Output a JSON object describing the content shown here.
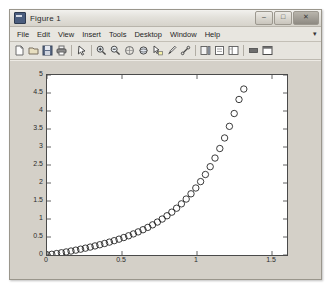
{
  "window": {
    "title": "Figure 1",
    "icon": "matlab-figure-icon",
    "buttons": [
      {
        "name": "minimize",
        "glyph": "–"
      },
      {
        "name": "maximize",
        "glyph": "□"
      },
      {
        "name": "close",
        "glyph": "✕"
      }
    ]
  },
  "menu": {
    "items": [
      "File",
      "Edit",
      "View",
      "Insert",
      "Tools",
      "Desktop",
      "Window",
      "Help"
    ],
    "overflow_glyph": "▾"
  },
  "toolbar": {
    "items": [
      {
        "name": "new-figure-icon",
        "tip": "New Figure"
      },
      {
        "name": "open-file-icon",
        "tip": "Open File"
      },
      {
        "name": "save-figure-icon",
        "tip": "Save Figure"
      },
      {
        "name": "print-figure-icon",
        "tip": "Print Figure"
      },
      {
        "name": "separator-1",
        "tip": ""
      },
      {
        "name": "edit-plot-arrow-icon",
        "tip": "Edit Plot"
      },
      {
        "name": "separator-2",
        "tip": ""
      },
      {
        "name": "zoom-in-icon",
        "tip": "Zoom In"
      },
      {
        "name": "zoom-out-icon",
        "tip": "Zoom Out"
      },
      {
        "name": "pan-icon",
        "tip": "Pan"
      },
      {
        "name": "rotate-3d-icon",
        "tip": "Rotate 3D"
      },
      {
        "name": "data-cursor-icon",
        "tip": "Data Cursor"
      },
      {
        "name": "brush-icon",
        "tip": "Brush/Select Data"
      },
      {
        "name": "link-plot-icon",
        "tip": "Link Plot"
      },
      {
        "name": "separator-3",
        "tip": ""
      },
      {
        "name": "insert-colorbar-icon",
        "tip": "Insert Colorbar"
      },
      {
        "name": "insert-legend-icon",
        "tip": "Insert Legend"
      },
      {
        "name": "show-plot-tools-icon",
        "tip": "Show Plot Tools"
      },
      {
        "name": "separator-4",
        "tip": ""
      },
      {
        "name": "hide-plot-tools-icon",
        "tip": "Hide Plot Tools"
      },
      {
        "name": "dock-figure-icon",
        "tip": "Dock Figure"
      }
    ]
  },
  "chart_data": {
    "type": "scatter",
    "title": "",
    "xlabel": "",
    "ylabel": "",
    "xlim": [
      0,
      1.6
    ],
    "ylim": [
      0,
      5
    ],
    "xticks": [
      0,
      0.5,
      1,
      1.5
    ],
    "xtick_labels": [
      "0",
      "0.5",
      "1",
      "1.5"
    ],
    "yticks": [
      0,
      0.5,
      1,
      1.5,
      2,
      2.5,
      3,
      3.5,
      4,
      4.5,
      5
    ],
    "ytick_labels": [
      "0",
      "0.5",
      "1",
      "1.5",
      "2",
      "2.5",
      "3",
      "3.5",
      "4",
      "4.5",
      "5"
    ],
    "grid": false,
    "legend": null,
    "marker": "circle-open",
    "marker_color": "#1a1a1a",
    "marker_size": 3.2,
    "series": [
      {
        "name": "data",
        "x": [
          0.0,
          0.032,
          0.064,
          0.096,
          0.128,
          0.16,
          0.192,
          0.224,
          0.256,
          0.288,
          0.32,
          0.352,
          0.384,
          0.416,
          0.448,
          0.48,
          0.512,
          0.544,
          0.576,
          0.608,
          0.64,
          0.672,
          0.704,
          0.736,
          0.768,
          0.8,
          0.832,
          0.864,
          0.896,
          0.928,
          0.96,
          0.992,
          1.024,
          1.056,
          1.088,
          1.12,
          1.152,
          1.184,
          1.216,
          1.248,
          1.28,
          1.312
        ],
        "y": [
          0.005,
          0.02,
          0.04,
          0.062,
          0.085,
          0.11,
          0.135,
          0.162,
          0.19,
          0.22,
          0.252,
          0.285,
          0.32,
          0.358,
          0.398,
          0.44,
          0.485,
          0.534,
          0.586,
          0.642,
          0.702,
          0.767,
          0.838,
          0.915,
          0.999,
          1.09,
          1.19,
          1.3,
          1.421,
          1.554,
          1.7,
          1.861,
          2.039,
          2.236,
          2.453,
          2.693,
          2.958,
          3.251,
          3.574,
          3.93,
          4.32,
          4.61
        ]
      }
    ]
  },
  "ghost_text": [
    {
      "text": "— —— — — —— —",
      "x": 52,
      "y": 28
    },
    {
      "text": "—— — —— — ——",
      "x": 60,
      "y": 40
    },
    {
      "text": "— ——— — —",
      "x": 72,
      "y": 52
    },
    {
      "text": "—— — ——",
      "x": 80,
      "y": 64
    }
  ]
}
